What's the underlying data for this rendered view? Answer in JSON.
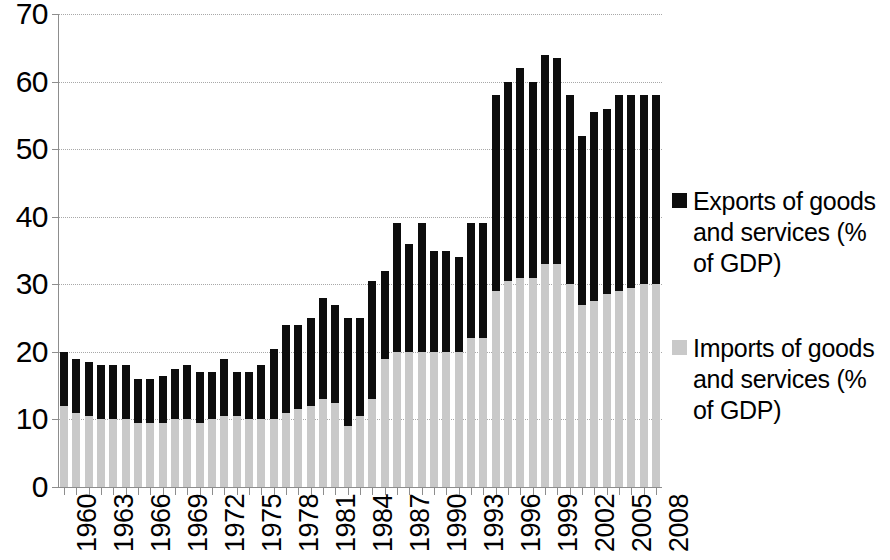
{
  "chart_data": {
    "type": "bar",
    "subtype": "stacked-column",
    "title": "",
    "xlabel": "",
    "ylabel": "",
    "ylim": [
      0,
      70
    ],
    "yticks": [
      0,
      10,
      20,
      30,
      40,
      50,
      60,
      70
    ],
    "grid": true,
    "legend_position": "right",
    "x": [
      1960,
      1961,
      1962,
      1963,
      1964,
      1965,
      1966,
      1967,
      1968,
      1969,
      1970,
      1971,
      1972,
      1973,
      1974,
      1975,
      1976,
      1977,
      1978,
      1979,
      1980,
      1981,
      1982,
      1983,
      1984,
      1985,
      1986,
      1987,
      1988,
      1989,
      1990,
      1991,
      1992,
      1993,
      1994,
      1995,
      1996,
      1997,
      1998,
      1999,
      2000,
      2001,
      2002,
      2003,
      2004,
      2005,
      2006,
      2007,
      2008
    ],
    "tick_labels": [
      "1960",
      "1963",
      "1966",
      "1969",
      "1972",
      "1975",
      "1978",
      "1981",
      "1984",
      "1987",
      "1990",
      "1993",
      "1996",
      "1999",
      "2002",
      "2005",
      "2008"
    ],
    "tick_label_step": 3,
    "series": [
      {
        "name": "Imports of goods and services (% of GDP)",
        "color": "#c9c9c9",
        "values": [
          12,
          11,
          10.5,
          10,
          10,
          10,
          9.5,
          9.5,
          9.5,
          10,
          10,
          9.5,
          10,
          10.5,
          10.5,
          10,
          10,
          10,
          11,
          11.5,
          12,
          13,
          12.5,
          9,
          10.5,
          13,
          19,
          20,
          20,
          20,
          20,
          20,
          20,
          22,
          22,
          29,
          30.5,
          31,
          31,
          33,
          33,
          30,
          27,
          27.5,
          28.5,
          29,
          29.5,
          30,
          30
        ]
      },
      {
        "name": "Exports of goods and services (% of GDP)",
        "color": "#0d0d0d",
        "values": [
          20,
          19,
          18.5,
          18,
          18,
          18,
          16,
          16,
          16.5,
          17.5,
          18,
          17,
          17,
          19,
          17,
          17,
          18,
          20.5,
          24,
          24,
          25,
          28,
          27,
          25,
          25,
          30.5,
          32,
          39,
          36,
          39,
          35,
          35,
          34,
          39,
          39,
          58,
          60,
          62,
          60,
          64,
          63.5,
          58,
          52,
          55.5,
          56,
          58,
          58,
          58,
          58
        ]
      }
    ],
    "totals_note": "Bar top = exports total; gray portion = imports"
  },
  "legend": {
    "entries": [
      {
        "label": "Exports of goods and services (% of GDP)",
        "color": "#0d0d0d",
        "swatch_name": "exports-swatch"
      },
      {
        "label": "Imports of goods and services (% of GDP)",
        "color": "#c9c9c9",
        "swatch_name": "imports-swatch"
      }
    ]
  }
}
